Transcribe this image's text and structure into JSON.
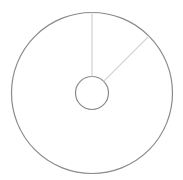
{
  "chart_data": {
    "type": "pie",
    "variant": "donut",
    "title": "",
    "categories": [
      "Slice A",
      "Slice B"
    ],
    "values": [
      12.5,
      87.5
    ],
    "start_angle_deg": 0,
    "direction": "clockwise",
    "legend": "none",
    "data_labels": [],
    "colors": {
      "outline": "#8a8a8a",
      "divider": "#d0d0d0",
      "fill": "#ffffff"
    }
  }
}
